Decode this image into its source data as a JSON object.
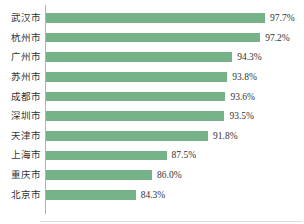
{
  "chart_data": {
    "type": "bar",
    "orientation": "horizontal",
    "title": "",
    "xlabel": "",
    "ylabel": "",
    "categories": [
      "武汉市",
      "杭州市",
      "广州市",
      "苏州市",
      "成都市",
      "深圳市",
      "天津市",
      "上海市",
      "重庆市",
      "北京市"
    ],
    "values": [
      97.7,
      97.2,
      94.3,
      93.8,
      93.6,
      93.5,
      91.8,
      87.5,
      86.0,
      84.3
    ],
    "value_labels": [
      "97.7%",
      "97.2%",
      "94.3%",
      "93.8%",
      "93.6%",
      "93.5%",
      "91.8%",
      "87.5%",
      "86.0%",
      "84.3%"
    ],
    "xlim": [
      75,
      100
    ],
    "grid": false,
    "legend": "none",
    "bar_color": "#75b287",
    "axis_line_color": "#b3b3b3",
    "baseline_color": "#dcdcdc",
    "text_color": "#333333"
  }
}
